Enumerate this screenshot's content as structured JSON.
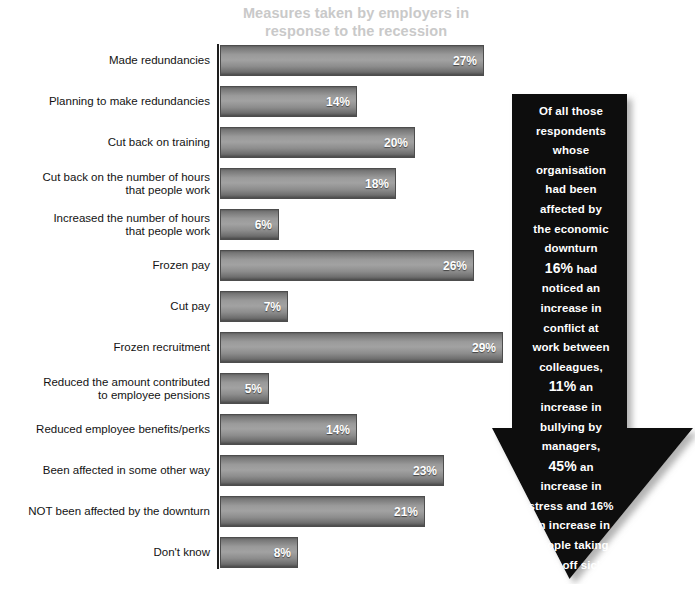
{
  "chart_data": {
    "type": "bar",
    "orientation": "horizontal",
    "title": "Measures taken by employers in response to the recession",
    "xlabel": "",
    "ylabel": "",
    "xlim": [
      0,
      30
    ],
    "grid": false,
    "legend": "none",
    "value_suffix": "%",
    "categories": [
      "Made redundancies",
      "Planning to make redundancies",
      "Cut back on training",
      "Cut back on the number of hours that people work",
      "Increased the number of hours that people work",
      "Frozen pay",
      "Cut pay",
      "Frozen recruitment",
      "Reduced the amount contributed to employee pensions",
      "Reduced employee benefits/perks",
      "Been affected in some other way",
      "NOT been affected by the downturn",
      "Don't know"
    ],
    "values": [
      27,
      14,
      20,
      18,
      6,
      26,
      7,
      29,
      5,
      14,
      23,
      21,
      8
    ],
    "data_labels": [
      "27%",
      "14%",
      "20%",
      "18%",
      "6%",
      "26%",
      "7%",
      "29%",
      "5%",
      "14%",
      "23%",
      "21%",
      "8%"
    ]
  },
  "chart": {
    "title_line1": "Measures taken by employers in",
    "title_line2": "response to the recession",
    "title_color": "#c9c9c9",
    "bar_color_light": "#a2a2a2",
    "bar_color_dark": "#4a4a4a",
    "value_text_color": "#ffffff",
    "axis_color": "#1d1d1d",
    "bars": [
      {
        "label_line1": "Made redundancies",
        "label_line2": "",
        "value": 27,
        "value_label": "27%"
      },
      {
        "label_line1": "Planning to make redundancies",
        "label_line2": "",
        "value": 14,
        "value_label": "14%"
      },
      {
        "label_line1": "Cut back on training",
        "label_line2": "",
        "value": 20,
        "value_label": "20%"
      },
      {
        "label_line1": "Cut back on the number of hours",
        "label_line2": "that people work",
        "value": 18,
        "value_label": "18%"
      },
      {
        "label_line1": "Increased the number of hours",
        "label_line2": "that people work",
        "value": 6,
        "value_label": "6%"
      },
      {
        "label_line1": "Frozen pay",
        "label_line2": "",
        "value": 26,
        "value_label": "26%"
      },
      {
        "label_line1": "Cut pay",
        "label_line2": "",
        "value": 7,
        "value_label": "7%"
      },
      {
        "label_line1": "Frozen recruitment",
        "label_line2": "",
        "value": 29,
        "value_label": "29%"
      },
      {
        "label_line1": "Reduced the amount contributed",
        "label_line2": "to employee pensions",
        "value": 5,
        "value_label": "5%"
      },
      {
        "label_line1": "Reduced employee benefits/perks",
        "label_line2": "",
        "value": 14,
        "value_label": "14%"
      },
      {
        "label_line1": "Been affected in some other way",
        "label_line2": "",
        "value": 23,
        "value_label": "23%"
      },
      {
        "label_line1": "NOT been affected by the downturn",
        "label_line2": "",
        "value": 21,
        "value_label": "21%"
      },
      {
        "label_line1": "Don't know",
        "label_line2": "",
        "value": 8,
        "value_label": "8%"
      }
    ]
  },
  "callout": {
    "shape": "down-arrow",
    "background_color": "#0d0d0d",
    "text_color": "#ffffff",
    "lines": [
      {
        "text": "Of all those",
        "emphasis": false
      },
      {
        "text": "respondents",
        "emphasis": false
      },
      {
        "text": "whose",
        "emphasis": false
      },
      {
        "text": "organisation",
        "emphasis": false
      },
      {
        "text": "had been",
        "emphasis": false
      },
      {
        "text": "affected by",
        "emphasis": false
      },
      {
        "text": "the economic",
        "emphasis": false
      },
      {
        "text": "downturn",
        "emphasis": false
      },
      {
        "text": "16%",
        "emphasis": true,
        "suffix": " had"
      },
      {
        "text": "noticed an",
        "emphasis": false
      },
      {
        "text": "increase in",
        "emphasis": false
      },
      {
        "text": "conflict at",
        "emphasis": false
      },
      {
        "text": "work between",
        "emphasis": false
      },
      {
        "text": "colleagues,",
        "emphasis": false
      },
      {
        "text": "11%",
        "emphasis": true,
        "suffix": " an"
      },
      {
        "text": "increase in",
        "emphasis": false
      },
      {
        "text": "bullying by",
        "emphasis": false
      },
      {
        "text": "managers,",
        "emphasis": false
      },
      {
        "text": "45%",
        "emphasis": true,
        "suffix": " an"
      },
      {
        "text": "increase in",
        "emphasis": false
      },
      {
        "text": "stress and 16%",
        "emphasis": false
      },
      {
        "text": "an increase in",
        "emphasis": false
      },
      {
        "text": "people taking",
        "emphasis": false
      },
      {
        "text": "time off sick.",
        "emphasis": false
      }
    ],
    "full_text": "Of all those respondents whose organisation had been affected by the economic downturn 16% had noticed an increase in conflict at work between colleagues, 11% an increase in bullying by managers, 45% an increase in stress and 16% an increase in people taking time off sick."
  },
  "layout": {
    "bar_origin_x": 220,
    "bar_first_top": 45,
    "bar_pitch": 41,
    "bar_height": 31,
    "px_per_percent": 9.76
  }
}
